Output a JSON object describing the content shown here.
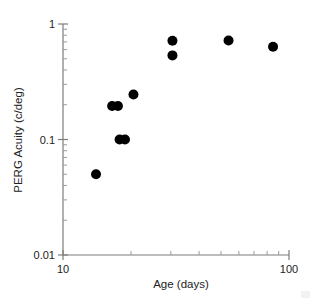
{
  "chart_data": {
    "type": "scatter",
    "title": "",
    "xlabel": "Age (days)",
    "ylabel": "PERG Acuity (c/deg)",
    "xscale": "log",
    "yscale": "log",
    "xlim": [
      10,
      100
    ],
    "ylim": [
      0.01,
      1
    ],
    "grid": false,
    "legend": null,
    "legend_position": "none",
    "marker": "filled-circle",
    "marker_color": "#000000",
    "x_ticklabels": [
      "10",
      "100"
    ],
    "x_tickvalues": [
      10,
      100
    ],
    "y_ticklabels": [
      "1",
      "0.1",
      "0.01"
    ],
    "y_tickvalues": [
      1,
      0.1,
      0.01
    ],
    "x_minor_ticks": [
      20,
      30,
      40,
      50,
      60,
      70,
      80,
      90
    ],
    "y_minor_ticks": [
      0.9,
      0.8,
      0.7,
      0.6,
      0.5,
      0.4,
      0.3,
      0.2,
      0.09,
      0.08,
      0.07,
      0.06,
      0.05,
      0.04,
      0.03,
      0.02
    ],
    "points": [
      {
        "x": 14.0,
        "y": 0.05
      },
      {
        "x": 16.5,
        "y": 0.195
      },
      {
        "x": 17.5,
        "y": 0.195
      },
      {
        "x": 17.8,
        "y": 0.1
      },
      {
        "x": 18.8,
        "y": 0.1
      },
      {
        "x": 20.5,
        "y": 0.245
      },
      {
        "x": 30.5,
        "y": 0.715
      },
      {
        "x": 30.5,
        "y": 0.535
      },
      {
        "x": 54.0,
        "y": 0.72
      },
      {
        "x": 85.0,
        "y": 0.635
      }
    ],
    "x": [
      14.0,
      16.5,
      17.5,
      17.8,
      18.8,
      20.5,
      30.5,
      30.5,
      54.0,
      85.0
    ],
    "values": [
      0.05,
      0.195,
      0.195,
      0.1,
      0.1,
      0.245,
      0.715,
      0.535,
      0.72,
      0.635
    ]
  },
  "axes": {
    "x_title": "Age (days)",
    "y_title": "PERG Acuity (c/deg)"
  }
}
